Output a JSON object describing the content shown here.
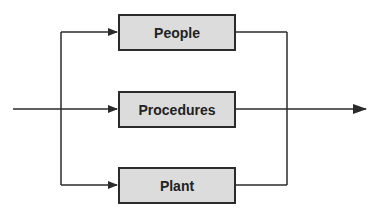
{
  "diagram": {
    "type": "parallel-flow",
    "colors": {
      "box_fill": "#dcdcdc",
      "line": "#2b2b2b",
      "background": "#ffffff"
    },
    "nodes": [
      {
        "id": "people",
        "label": "People"
      },
      {
        "id": "procedures",
        "label": "Procedures"
      },
      {
        "id": "plant",
        "label": "Plant"
      }
    ],
    "edges": [
      {
        "from": "input",
        "to": "people"
      },
      {
        "from": "input",
        "to": "procedures"
      },
      {
        "from": "input",
        "to": "plant"
      },
      {
        "from": "people",
        "to": "output"
      },
      {
        "from": "procedures",
        "to": "output"
      },
      {
        "from": "plant",
        "to": "output"
      }
    ]
  }
}
